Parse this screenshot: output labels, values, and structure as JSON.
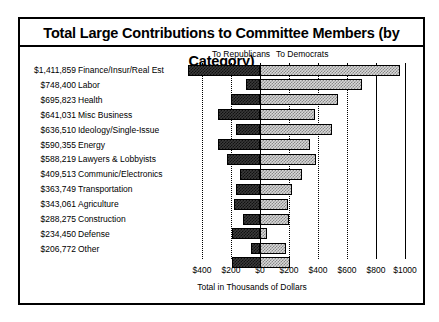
{
  "chart_data": {
    "type": "bar",
    "orientation": "horizontal",
    "stacked": "diverging",
    "title": "Total Large Contributions to Committee Members (by Category)",
    "xlabel": "Total in Thousands of Dollars",
    "ylabel": "",
    "legend_position": "top",
    "grid": true,
    "xlim": [
      -500,
      1070
    ],
    "xticks": [
      -400,
      -200,
      0,
      200,
      400,
      600,
      800,
      1000
    ],
    "xtick_labels": [
      "$400",
      "$200",
      "$0",
      "$200",
      "$400",
      "$600",
      "$800",
      "$1000"
    ],
    "xtick_note": "Values left of $0 are To Republicans; right of $0 are To Democrats",
    "categories": [
      "Finance/Insur/Real Est",
      "Labor",
      "Health",
      "Misc Business",
      "Ideology/Single-Issue",
      "Energy",
      "Lawyers & Lobbyists",
      "Communic/Electronics",
      "Transportation",
      "Agriculture",
      "Construction",
      "Defense",
      "Other"
    ],
    "totals_labels": [
      "$1,411,859",
      "$748,400",
      "$695,823",
      "$641,031",
      "$636,510",
      "$590,355",
      "$588,219",
      "$409,513",
      "$363,749",
      "$343,061",
      "$288,275",
      "$234,450",
      "$206,772"
    ],
    "totals_values": [
      1411859,
      748400,
      695823,
      641031,
      636510,
      590355,
      588219,
      409513,
      363749,
      343061,
      288275,
      234450,
      206772
    ],
    "series": [
      {
        "name": "To Republicans",
        "values": [
          497,
          97,
          200,
          290,
          166,
          290,
          228,
          138,
          166,
          180,
          117,
          193,
          62
        ]
      },
      {
        "name": "To Democrats",
        "values": [
          966,
          703,
          538,
          379,
          497,
          345,
          386,
          290,
          221,
          193,
          200,
          48,
          179
        ]
      }
    ],
    "units": "thousands of dollars"
  },
  "legend": {
    "republicans": "To Republicans",
    "democrats": "To Democrats"
  }
}
